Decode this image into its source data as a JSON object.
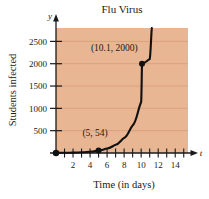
{
  "chart_data": {
    "type": "line",
    "title": "Flu Virus",
    "xlabel": "Time (in days)",
    "ylabel": "Students infected",
    "x_axis_symbol": "t",
    "y_axis_symbol": "y",
    "xlim": [
      0,
      15.5
    ],
    "ylim": [
      0,
      2800
    ],
    "grid": true,
    "legend": "none",
    "xticks": [
      2,
      4,
      6,
      8,
      10,
      12,
      14
    ],
    "xtick_labels": [
      "2",
      "4",
      "6",
      "8",
      "10",
      "12",
      "14"
    ],
    "xticks_minor": [
      1,
      3,
      5,
      7,
      9,
      11,
      13,
      15
    ],
    "yticks": [
      500,
      1000,
      1500,
      2000,
      2500
    ],
    "ytick_labels": [
      "500",
      "1000",
      "1500",
      "2000",
      "2500"
    ],
    "series": [
      {
        "name": "infected",
        "x": [
          0,
          1,
          2,
          3,
          4,
          5,
          6,
          7,
          8,
          9,
          10,
          10.1,
          11,
          11.25
        ],
        "values": [
          3,
          5,
          9,
          16,
          29,
          54,
          99,
          183,
          337,
          620,
          1142,
          2000,
          2102,
          2800
        ]
      }
    ],
    "points": [
      {
        "label": "(5, 54)",
        "x": 5,
        "y": 54,
        "label_x": 3.1,
        "label_y": 380
      },
      {
        "label": "(10.1, 2000)",
        "x": 10.1,
        "y": 2000,
        "label_x": 4.1,
        "label_y": 2290
      }
    ],
    "colors": {
      "plot_background": "#e8b692",
      "curve": "#111111",
      "axis": "#1a1a1a",
      "gridline": "#d49a76",
      "point": "#111111",
      "page_background": "#ffffff"
    }
  }
}
